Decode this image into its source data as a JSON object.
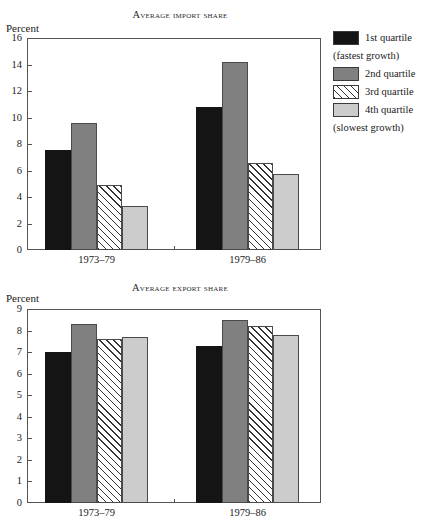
{
  "legend": {
    "items": [
      {
        "label": "1st quartile",
        "fill": "solid-black",
        "color": "#141414"
      },
      {
        "label": "2nd quartile",
        "fill": "solid-gray",
        "color": "#808080"
      },
      {
        "label": "3rd quartile",
        "fill": "diagonal-hatch",
        "color": "#ffffff"
      },
      {
        "label": "4th quartile",
        "fill": "light-gray",
        "color": "#cccccc"
      }
    ],
    "note_fastest": "(fastest growth)",
    "note_slowest": "(slowest growth)"
  },
  "chart_data": [
    {
      "type": "bar",
      "title": "Average import share",
      "ylabel": "Percent",
      "xlabel": "",
      "categories": [
        "1973–79",
        "1979–86"
      ],
      "ylim": [
        0,
        16
      ],
      "yticks": [
        0,
        2,
        4,
        6,
        8,
        10,
        12,
        14,
        16
      ],
      "ytick_labels": [
        "0",
        "2",
        "4",
        "6",
        "8",
        "10",
        "12",
        "14",
        "16"
      ],
      "grid": false,
      "legend_position": "right",
      "series": [
        {
          "name": "1st quartile",
          "values": [
            7.55,
            10.8
          ]
        },
        {
          "name": "2nd quartile",
          "values": [
            9.6,
            14.2
          ]
        },
        {
          "name": "3rd quartile",
          "values": [
            4.9,
            6.6
          ]
        },
        {
          "name": "4th quartile",
          "values": [
            3.35,
            5.75
          ]
        }
      ]
    },
    {
      "type": "bar",
      "title": "Average export share",
      "ylabel": "Percent",
      "xlabel": "",
      "categories": [
        "1973–79",
        "1979–86"
      ],
      "ylim": [
        0,
        9
      ],
      "yticks": [
        0,
        1,
        2,
        3,
        4,
        5,
        6,
        7,
        8,
        9
      ],
      "ytick_labels": [
        "0",
        "1",
        "2",
        "3",
        "4",
        "5",
        "6",
        "7",
        "8",
        "9"
      ],
      "grid": false,
      "legend_position": "none",
      "series": [
        {
          "name": "1st quartile",
          "values": [
            7.0,
            7.3
          ]
        },
        {
          "name": "2nd quartile",
          "values": [
            8.3,
            8.5
          ]
        },
        {
          "name": "3rd quartile",
          "values": [
            7.6,
            8.2
          ]
        },
        {
          "name": "4th quartile",
          "values": [
            7.7,
            7.8
          ]
        }
      ]
    }
  ]
}
